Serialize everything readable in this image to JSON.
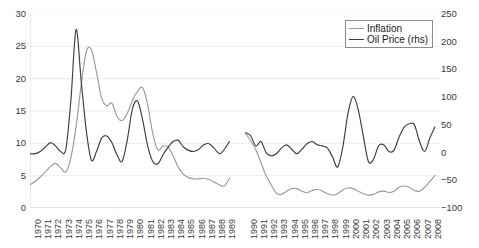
{
  "chart_data": {
    "type": "line",
    "title": "",
    "xlabel": "",
    "ylabel": "",
    "y2label": "",
    "grid": true,
    "legend_position": "top-right",
    "ylim": [
      0,
      30
    ],
    "y2lim": [
      -100,
      250
    ],
    "yticks": [
      "0",
      "5",
      "10",
      "15",
      "20",
      "25",
      "30"
    ],
    "y2ticks": [
      "-100",
      "-50",
      "0",
      "50",
      "100",
      "150",
      "200",
      "250"
    ],
    "xlim": [
      1970,
      2008
    ],
    "gap_between": [
      1989,
      1990
    ],
    "categories": [
      "1970",
      "1971",
      "1972",
      "1973",
      "1974",
      "1975",
      "1976",
      "1977",
      "1978",
      "1979",
      "1980",
      "1981",
      "1982",
      "1983",
      "1984",
      "1985",
      "1986",
      "1987",
      "1988",
      "1989",
      "1990",
      "1991",
      "1992",
      "1993",
      "1994",
      "1995",
      "1996",
      "1997",
      "1998",
      "1999",
      "2000",
      "2001",
      "2002",
      "2003",
      "2004",
      "2005",
      "2006",
      "2007",
      "2008"
    ],
    "series": [
      {
        "name": "Inflation",
        "axis": "left",
        "color": "#9a9a9a",
        "values_by_year": {
          "1970": 3.6,
          "1970.5": 4.1,
          "1971": 4.8,
          "1971.5": 5.6,
          "1972": 6.4,
          "1972.5": 6.9,
          "1973": 6.2,
          "1973.5": 5.6,
          "1974": 7.8,
          "1974.5": 12.5,
          "1975": 19.0,
          "1975.5": 24.2,
          "1976": 24.5,
          "1976.5": 21.0,
          "1977": 17.0,
          "1977.5": 15.8,
          "1978": 16.2,
          "1978.5": 14.2,
          "1979": 13.5,
          "1979.5": 14.6,
          "1980": 16.6,
          "1980.5": 18.0,
          "1981": 18.6,
          "1981.5": 16.0,
          "1982": 11.5,
          "1982.5": 9.0,
          "1983": 9.6,
          "1983.5": 9.4,
          "1984": 8.0,
          "1984.5": 6.3,
          "1985": 5.2,
          "1985.5": 4.7,
          "1986": 4.5,
          "1986.5": 4.5,
          "1987": 4.6,
          "1987.5": 4.4,
          "1988": 4.0,
          "1988.5": 3.6,
          "1989": 3.4,
          "1989.5": 4.6,
          "1990": 11.5,
          "1990.5": 10.4,
          "1991": 9.0,
          "1991.5": 7.0,
          "1992": 5.0,
          "1992.5": 3.6,
          "1993": 2.3,
          "1993.5": 2.1,
          "1994": 2.6,
          "1994.5": 3.0,
          "1995": 3.0,
          "1995.5": 2.6,
          "1996": 2.4,
          "1996.5": 2.7,
          "1997": 2.9,
          "1997.5": 2.6,
          "1998": 2.2,
          "1998.5": 2.0,
          "1999": 2.2,
          "1999.5": 2.8,
          "2000": 3.1,
          "2000.5": 3.0,
          "2001": 2.6,
          "2001.5": 2.2,
          "2002": 2.0,
          "2002.5": 2.1,
          "2003": 2.5,
          "2003.5": 2.6,
          "2004": 2.4,
          "2004.5": 2.6,
          "2005": 3.2,
          "2005.5": 3.4,
          "2006": 3.2,
          "2006.5": 2.7,
          "2007": 2.6,
          "2007.5": 3.2,
          "2008": 4.1,
          "2008.5": 5.0
        }
      },
      {
        "name": "Oil Price (rhs)",
        "axis": "right",
        "color": "#3d3d3d",
        "values_by_year": {
          "1970": -2,
          "1970.5": -2,
          "1971": 2,
          "1971.5": 10,
          "1972": 18,
          "1972.5": 12,
          "1973": 2,
          "1973.5": 6,
          "1974": 95,
          "1974.5": 222,
          "1975": 130,
          "1975.5": 40,
          "1976": -14,
          "1976.5": 2,
          "1977": 26,
          "1977.5": 30,
          "1978": 18,
          "1978.5": -4,
          "1979": -16,
          "1979.5": 22,
          "1980": 78,
          "1980.5": 93,
          "1981": 60,
          "1981.5": 12,
          "1982": -16,
          "1982.5": -20,
          "1983": -4,
          "1983.5": 10,
          "1984": 20,
          "1984.5": 22,
          "1985": 10,
          "1985.5": 4,
          "1986": 2,
          "1986.5": 6,
          "1987": 14,
          "1987.5": 16,
          "1988": 8,
          "1988.5": -2,
          "1989": 6,
          "1989.5": 20,
          "1990": 36,
          "1990.5": 30,
          "1991": 12,
          "1991.5": 20,
          "1992": 0,
          "1992.5": -6,
          "1993": -2,
          "1993.5": 8,
          "1994": 14,
          "1994.5": 6,
          "1995": -2,
          "1995.5": 6,
          "1996": 16,
          "1996.5": 20,
          "1997": 14,
          "1997.5": 12,
          "1998": 8,
          "1998.5": -8,
          "1999": -26,
          "1999.5": 10,
          "2000": 70,
          "2000.5": 101,
          "2001": 78,
          "2001.5": 30,
          "2002": -16,
          "2002.5": -12,
          "2003": 12,
          "2003.5": 14,
          "2004": 2,
          "2004.5": 4,
          "2005": 28,
          "2005.5": 46,
          "2006": 52,
          "2006.5": 50,
          "2007": 20,
          "2007.5": 2,
          "2008": 26,
          "2008.5": 46
        }
      }
    ]
  },
  "legend": {
    "items": [
      {
        "label": "Inflation",
        "color": "#9a9a9a"
      },
      {
        "label": "Oil Price (rhs)",
        "color": "#3d3d3d"
      }
    ]
  }
}
